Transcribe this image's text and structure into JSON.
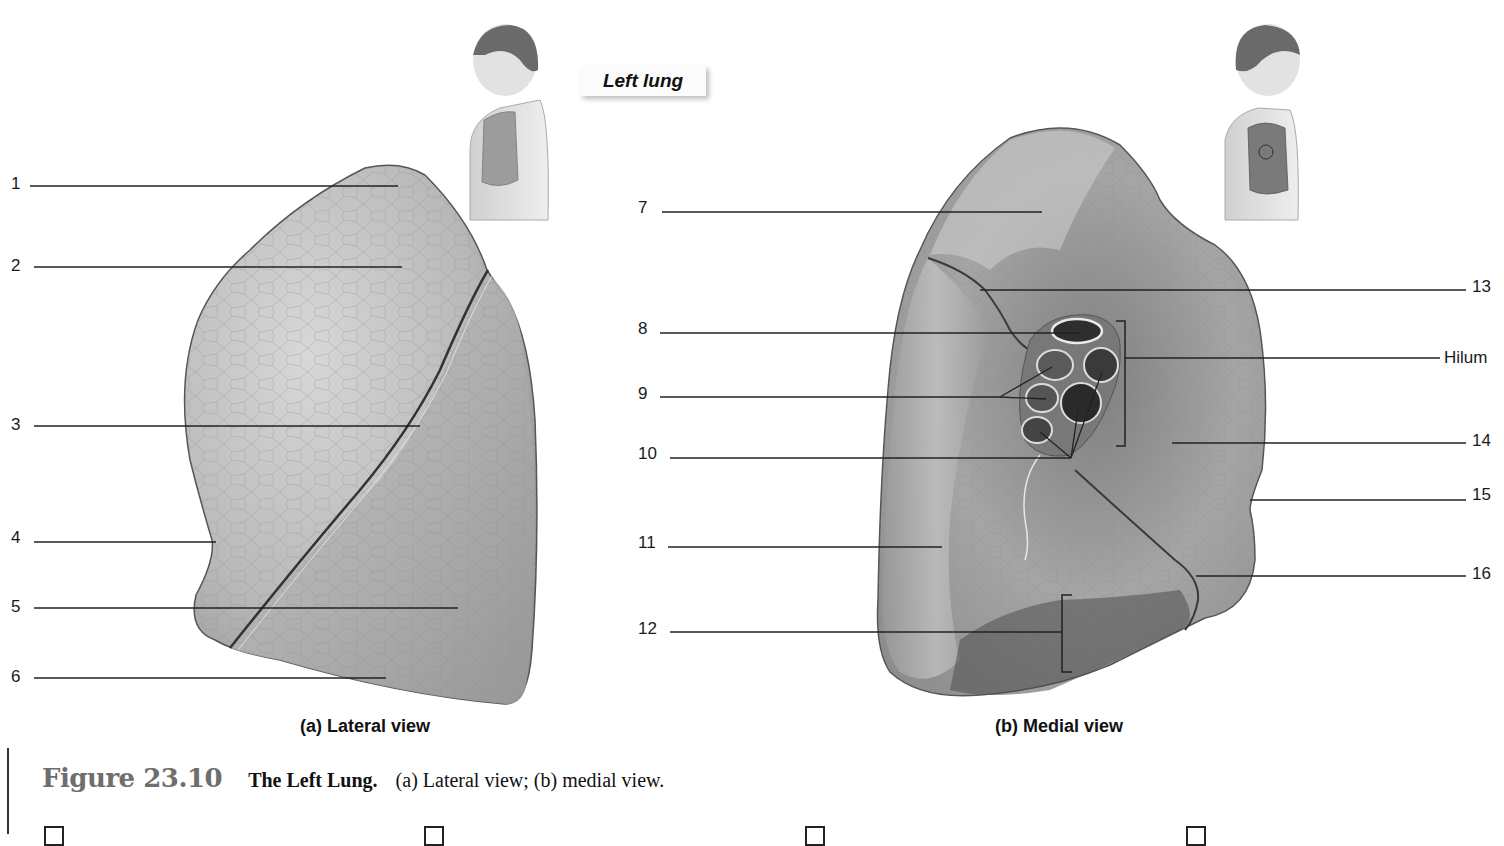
{
  "header": {
    "title": "Left lung"
  },
  "views": [
    {
      "id": "a",
      "caption": "(a) Lateral view"
    },
    {
      "id": "b",
      "caption": "(b) Medial view"
    }
  ],
  "labels": {
    "lateral": [
      {
        "num": "1"
      },
      {
        "num": "2"
      },
      {
        "num": "3"
      },
      {
        "num": "4"
      },
      {
        "num": "5"
      },
      {
        "num": "6"
      }
    ],
    "medial_left": [
      {
        "num": "7"
      },
      {
        "num": "8"
      },
      {
        "num": "9"
      },
      {
        "num": "10"
      },
      {
        "num": "11"
      },
      {
        "num": "12"
      }
    ],
    "medial_right": [
      {
        "num": "13"
      },
      {
        "num": "Hilum"
      },
      {
        "num": "14"
      },
      {
        "num": "15"
      },
      {
        "num": "16"
      }
    ]
  },
  "figure": {
    "number": "Figure 23.10",
    "name": "The Left Lung.",
    "description": "(a) Lateral view; (b) medial view."
  },
  "checkboxes": [
    {
      "checked": false
    },
    {
      "checked": false
    },
    {
      "checked": false
    },
    {
      "checked": false
    }
  ],
  "colors": {
    "lung_light": "#c9c9c9",
    "lung_mid": "#a8a8a8",
    "lung_dark": "#6f6f6f",
    "leader_line": "#222222"
  }
}
